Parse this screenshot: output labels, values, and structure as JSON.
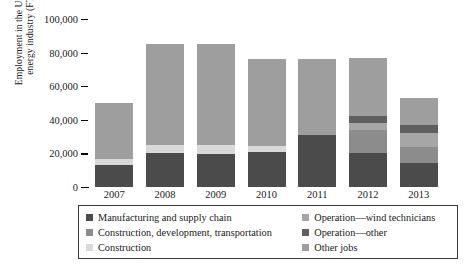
{
  "chart_data": {
    "type": "bar",
    "stacked": true,
    "title": "",
    "xlabel": "",
    "ylabel": "Employment in the US wind\nenergy industry (FTEs)",
    "ylim": [
      0,
      100000
    ],
    "ytick_labels": [
      "100,000",
      "80,000",
      "60,000",
      "40,000",
      "20,000",
      "0"
    ],
    "ytick_values": [
      100000,
      80000,
      60000,
      40000,
      20000,
      0
    ],
    "categories": [
      "2007",
      "2008",
      "2009",
      "2010",
      "2011",
      "2012",
      "2013"
    ],
    "grid": false,
    "legend_position": "below-axes",
    "series": [
      {
        "name": "Manufacturing and supply chain",
        "color": "#4b4b4b",
        "values": [
          13000,
          20500,
          19500,
          21000,
          31000,
          20000,
          14500
        ]
      },
      {
        "name": "Construction, development, transportation",
        "color": "#8c8c8c",
        "values": [
          0,
          0,
          0,
          0,
          0,
          14000,
          9500
        ]
      },
      {
        "name": "Construction",
        "color": "#d9d9d9",
        "values": [
          3500,
          4500,
          5500,
          3500,
          0,
          0,
          0
        ]
      },
      {
        "name": "Operation—wind technicians",
        "color": "#a6a6a6",
        "values": [
          0,
          0,
          0,
          0,
          0,
          4000,
          8000
        ]
      },
      {
        "name": "Operation—other",
        "color": "#5f5f5f",
        "values": [
          0,
          0,
          0,
          0,
          0,
          4000,
          5000
        ]
      },
      {
        "name": "Other jobs",
        "color": "#9e9e9e",
        "values": [
          33500,
          60000,
          60000,
          51500,
          45000,
          35000,
          16000
        ]
      }
    ],
    "totals": [
      50000,
      85000,
      85000,
      76000,
      76000,
      77000,
      53000
    ]
  },
  "legend": {
    "left_items": [
      {
        "label": "Manufacturing and supply chain",
        "color": "#4b4b4b"
      },
      {
        "label": "Construction, development, transportation",
        "color": "#8c8c8c"
      },
      {
        "label": "Construction",
        "color": "#d9d9d9"
      }
    ],
    "right_items": [
      {
        "label": "Operation—wind technicians",
        "color": "#a6a6a6"
      },
      {
        "label": "Operation—other",
        "color": "#5f5f5f"
      },
      {
        "label": "Other jobs",
        "color": "#9e9e9e"
      }
    ]
  }
}
